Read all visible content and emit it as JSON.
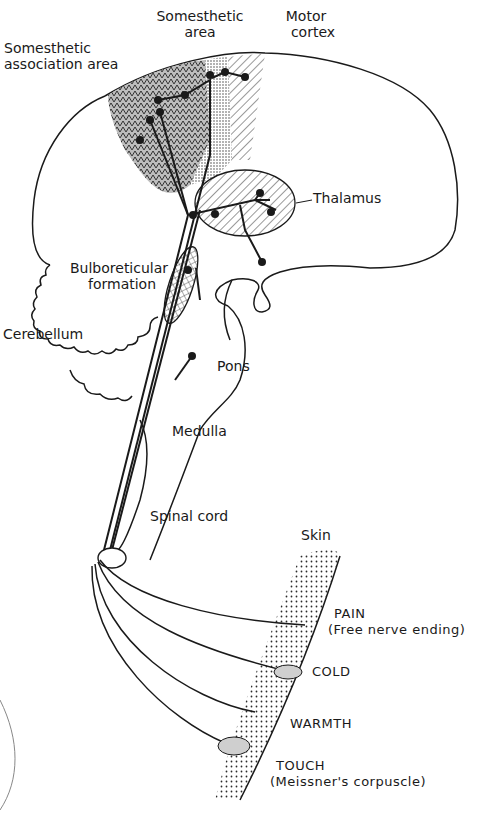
{
  "diagram": {
    "colors": {
      "ink": "#1a1a1a",
      "background": "#ffffff",
      "stipple": "#2a2a2a"
    },
    "labels": {
      "somesthetic_area": [
        "Somesthetic",
        "area"
      ],
      "motor_cortex": [
        "Motor",
        "cortex"
      ],
      "somesthetic_association_area": [
        "Somesthetic",
        "association area"
      ],
      "thalamus": "Thalamus",
      "bulboreticular_formation": [
        "Bulboreticular",
        "formation"
      ],
      "cerebellum": "Cerebellum",
      "pons": "Pons",
      "medulla": "Medulla",
      "spinal_cord": "Spinal cord",
      "skin": "Skin"
    },
    "receptors": [
      {
        "name": "PAIN",
        "detail": "(Free nerve ending)"
      },
      {
        "name": "COLD",
        "detail": ""
      },
      {
        "name": "WARMTH",
        "detail": ""
      },
      {
        "name": "TOUCH",
        "detail": "(Meissner's corpuscle)"
      }
    ]
  }
}
